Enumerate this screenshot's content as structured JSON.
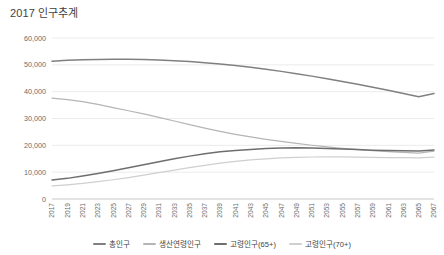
{
  "title": "2017 인구추계",
  "colors": {
    "total": "#808080",
    "working_age": "#b5b5b5",
    "aged65": "#6e6e6e",
    "aged70": "#cfcfcf",
    "grid": "#e3e3e3",
    "axis": "#c9c9c9",
    "text": "#6b6b6b",
    "title_text": "#3f3f3f"
  },
  "chart_data": {
    "type": "line",
    "title": "2017 인구추계",
    "xlabel": "",
    "ylabel": "",
    "ylim": [
      0,
      60000
    ],
    "ytick_values": [
      0,
      10000,
      20000,
      30000,
      40000,
      50000,
      60000
    ],
    "ytick_labels": [
      "0",
      "10,000",
      "20,000",
      "30,000",
      "40,000",
      "50,000",
      "60,000"
    ],
    "grid": true,
    "grid_axis": "y",
    "legend_position": "bottom",
    "xtick_rotation": -90,
    "x": [
      2017,
      2019,
      2021,
      2023,
      2025,
      2027,
      2029,
      2031,
      2033,
      2035,
      2037,
      2039,
      2041,
      2043,
      2045,
      2047,
      2049,
      2051,
      2053,
      2055,
      2057,
      2059,
      2061,
      2063,
      2065,
      2067
    ],
    "categories": [
      "2017",
      "2019",
      "2021",
      "2023",
      "2025",
      "2027",
      "2029",
      "2031",
      "2033",
      "2035",
      "2037",
      "2039",
      "2041",
      "2043",
      "2045",
      "2047",
      "2049",
      "2051",
      "2053",
      "2055",
      "2057",
      "2059",
      "2061",
      "2063",
      "2065",
      "2067"
    ],
    "series": [
      {
        "name": "총인구",
        "color": "#808080",
        "values": [
          51362,
          51709,
          51922,
          52025,
          52061,
          52037,
          51942,
          51772,
          51525,
          51197,
          50786,
          50294,
          49724,
          49078,
          48357,
          47565,
          46707,
          45791,
          44823,
          43807,
          42746,
          41643,
          40501,
          39323,
          38123,
          39300
        ]
      },
      {
        "name": "생산연령인구",
        "color": "#b5b5b5",
        "values": [
          37572,
          37048,
          36283,
          35284,
          34032,
          32893,
          31739,
          30435,
          29083,
          27717,
          26403,
          25190,
          24095,
          23121,
          22254,
          21466,
          20723,
          20032,
          19395,
          18838,
          18369,
          17982,
          17659,
          17379,
          17118,
          17840
        ]
      },
      {
        "name": "고령인구(65+)",
        "color": "#6e6e6e",
        "values": [
          7066,
          7690,
          8570,
          9503,
          10511,
          11636,
          12781,
          13897,
          14981,
          15981,
          16871,
          17587,
          18112,
          18492,
          18790,
          18990,
          19067,
          19002,
          18836,
          18628,
          18412,
          18213,
          18057,
          17962,
          17920,
          18270
        ]
      },
      {
        "name": "고령인구(70+)",
        "color": "#cfcfcf",
        "values": [
          4860,
          5270,
          5790,
          6450,
          7180,
          7990,
          8880,
          9830,
          10760,
          11680,
          12560,
          13350,
          14020,
          14560,
          14990,
          15310,
          15530,
          15650,
          15690,
          15670,
          15610,
          15530,
          15450,
          15390,
          15360,
          15600
        ]
      }
    ]
  },
  "legend": {
    "items": [
      {
        "label": "총인구",
        "color": "#808080"
      },
      {
        "label": "생산연령인구",
        "color": "#b5b5b5"
      },
      {
        "label": "고령인구(65+)",
        "color": "#6e6e6e"
      },
      {
        "label": "고령인구(70+)",
        "color": "#cfcfcf"
      }
    ]
  }
}
